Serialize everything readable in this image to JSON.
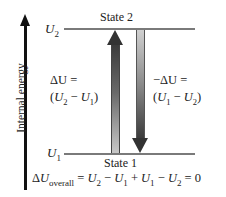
{
  "axis": {
    "label": "Internal energy",
    "direction": "up"
  },
  "levels": {
    "upper": {
      "symbol": "U",
      "subscript": "2",
      "state_label": "State 2"
    },
    "lower": {
      "symbol": "U",
      "subscript": "1",
      "state_label": "State 1"
    }
  },
  "arrows": {
    "up": {
      "line1": "ΔU =",
      "line2_open": "(",
      "a_sym": "U",
      "a_sub": "2",
      "op": " − ",
      "b_sym": "U",
      "b_sub": "1",
      "line2_close": ")"
    },
    "down": {
      "line1": "−ΔU =",
      "line2_open": "(",
      "a_sym": "U",
      "a_sub": "1",
      "op": " − ",
      "b_sym": "U",
      "b_sub": "2",
      "line2_close": ")"
    }
  },
  "equation": {
    "delta": "Δ",
    "sym": "U",
    "sub": "overall",
    "rhs_parts": [
      {
        "t": " = "
      },
      {
        "s": "U",
        "n": "2"
      },
      {
        "t": " − "
      },
      {
        "s": "U",
        "n": "1"
      },
      {
        "t": " + "
      },
      {
        "s": "U",
        "n": "1"
      },
      {
        "t": " − "
      },
      {
        "s": "U",
        "n": "2"
      },
      {
        "t": " = 0"
      }
    ]
  },
  "colors": {
    "level_line": "#7a7a7a",
    "axis": "#111111",
    "arrow_dark": "#333333",
    "arrow_light": "#cccccc"
  }
}
